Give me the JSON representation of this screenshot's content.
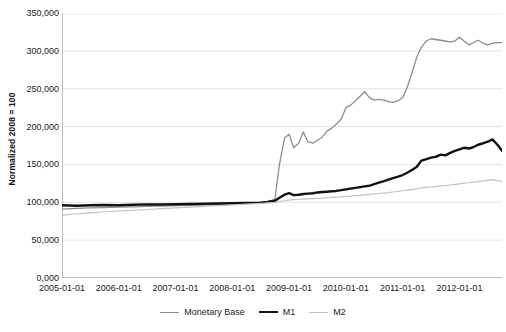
{
  "chart_data": {
    "type": "line",
    "title": "",
    "xlabel": "",
    "ylabel": "Normalized 2008 = 100",
    "ylim": [
      0,
      350000
    ],
    "xlim": [
      "2005-01-01",
      "2012-10-01"
    ],
    "grid": true,
    "legend_position": "bottom-center",
    "y_ticks": [
      "0,000",
      "50,000",
      "100,000",
      "150,000",
      "200,000",
      "250,000",
      "300,000",
      "350,000"
    ],
    "y_tick_values": [
      0,
      50000,
      100000,
      150000,
      200000,
      250000,
      300000,
      350000
    ],
    "x_ticks": [
      "2005-01-01",
      "2006-01-01",
      "2007-01-01",
      "2008-01-01",
      "2009-01-01",
      "2010-01-01",
      "2011-01-01",
      "2012-01-01"
    ],
    "x_tick_values": [
      2005.0,
      2006.0,
      2007.0,
      2008.0,
      2009.0,
      2010.0,
      2011.0,
      2012.0
    ],
    "colors": {
      "monetary_base": "#8c8c8c",
      "m1": "#111111",
      "m2": "#c2c2c2",
      "gridline": "#e3e3e3",
      "axis": "#bcbcbc",
      "background": "#ffffff"
    },
    "x": [
      2005.0,
      2005.25,
      2005.5,
      2005.75,
      2006.0,
      2006.25,
      2006.5,
      2006.75,
      2007.0,
      2007.25,
      2007.5,
      2007.75,
      2008.0,
      2008.25,
      2008.5,
      2008.62,
      2008.75,
      2008.83,
      2008.92,
      2009.0,
      2009.08,
      2009.17,
      2009.25,
      2009.33,
      2009.42,
      2009.5,
      2009.58,
      2009.67,
      2009.75,
      2009.83,
      2009.92,
      2010.0,
      2010.08,
      2010.17,
      2010.25,
      2010.33,
      2010.42,
      2010.5,
      2010.58,
      2010.67,
      2010.75,
      2010.83,
      2010.92,
      2011.0,
      2011.08,
      2011.17,
      2011.25,
      2011.33,
      2011.42,
      2011.5,
      2011.58,
      2011.67,
      2011.75,
      2011.83,
      2011.92,
      2012.0,
      2012.08,
      2012.17,
      2012.25,
      2012.33,
      2012.42,
      2012.5,
      2012.58,
      2012.67,
      2012.75
    ],
    "series": [
      {
        "name": "Monetary Base",
        "color": "#8c8c8c",
        "width": 1.3,
        "values": [
          91000,
          92000,
          92500,
          93000,
          93500,
          94000,
          94500,
          95000,
          95500,
          96000,
          96500,
          97000,
          98000,
          99000,
          100000,
          101000,
          104000,
          150000,
          185000,
          190000,
          172000,
          178000,
          193000,
          180000,
          178000,
          182000,
          186000,
          194000,
          198000,
          203000,
          210000,
          225000,
          228000,
          234000,
          240000,
          246000,
          238000,
          235000,
          236000,
          235000,
          233000,
          232000,
          234000,
          238000,
          252000,
          272000,
          292000,
          305000,
          313000,
          316000,
          315000,
          314000,
          313000,
          312000,
          313000,
          318000,
          313000,
          308000,
          311000,
          314000,
          310000,
          308000,
          310000,
          311000,
          311000
        ]
      },
      {
        "name": "M1",
        "color": "#111111",
        "width": 2.4,
        "values": [
          96000,
          95500,
          96000,
          96500,
          96000,
          96800,
          97200,
          97000,
          97500,
          97800,
          98000,
          98300,
          98800,
          99200,
          99500,
          100500,
          102000,
          106000,
          110000,
          112000,
          109500,
          110000,
          111000,
          111500,
          112000,
          113000,
          113500,
          114000,
          114500,
          115000,
          116000,
          117000,
          118000,
          119000,
          120000,
          121000,
          122000,
          124000,
          126000,
          128000,
          130000,
          132000,
          134000,
          136000,
          139000,
          143000,
          147000,
          155000,
          157000,
          159000,
          160000,
          163000,
          162000,
          165000,
          168000,
          170000,
          172000,
          171000,
          173000,
          176000,
          178000,
          180000,
          183000,
          176000,
          168000
        ]
      },
      {
        "name": "M2",
        "color": "#c2c2c2",
        "width": 1.2,
        "values": [
          83000,
          84500,
          86000,
          87500,
          88500,
          89500,
          90500,
          91500,
          92500,
          93500,
          94500,
          95500,
          96500,
          97500,
          98500,
          99200,
          100000,
          101000,
          102000,
          103000,
          103500,
          104000,
          104200,
          104500,
          104800,
          105200,
          105600,
          106000,
          106400,
          106800,
          107200,
          107800,
          108200,
          108800,
          109200,
          109800,
          110400,
          111000,
          111600,
          112200,
          112800,
          113600,
          114400,
          115200,
          116000,
          116800,
          117600,
          119000,
          119600,
          120200,
          120800,
          121600,
          122000,
          122800,
          123600,
          124400,
          125200,
          125800,
          126600,
          127400,
          128200,
          129000,
          130000,
          128500,
          127500
        ]
      }
    ]
  },
  "legend": {
    "items": [
      {
        "label": "Monetary Base"
      },
      {
        "label": "M1"
      },
      {
        "label": "M2"
      }
    ]
  }
}
